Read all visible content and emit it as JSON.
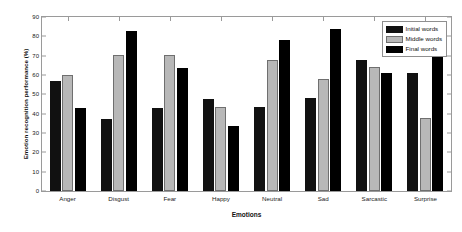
{
  "chart_data": {
    "type": "bar",
    "title": "",
    "xlabel": "Emotions",
    "ylabel": "Emotion recognition performance (%)",
    "categories": [
      "Anger",
      "Disgust",
      "Fear",
      "Happy",
      "Neutral",
      "Sad",
      "Sarcastic",
      "Surprise"
    ],
    "series": [
      {
        "name": "Initial words",
        "color": "#111111",
        "values": [
          57,
          37,
          43,
          47.5,
          43.5,
          48,
          68,
          61
        ]
      },
      {
        "name": "Middle words",
        "color": "#b8b8b8",
        "values": [
          60,
          70.5,
          70.5,
          43.5,
          68,
          58,
          64,
          38
        ]
      },
      {
        "name": "Final words",
        "color": "#000000",
        "values": [
          43,
          83,
          63.5,
          33.5,
          78,
          84,
          61,
          71
        ]
      }
    ],
    "ylim": [
      0,
      90
    ],
    "yticks": [
      0,
      10,
      20,
      30,
      40,
      50,
      60,
      70,
      80,
      90
    ],
    "ytick_labels": [
      "0",
      "10",
      "20",
      "30",
      "40",
      "50",
      "60",
      "70",
      "80",
      "90"
    ],
    "grid": false,
    "legend_position": "top-right",
    "axis_color": "#9a9a9a",
    "background_color": "#ffffff"
  }
}
